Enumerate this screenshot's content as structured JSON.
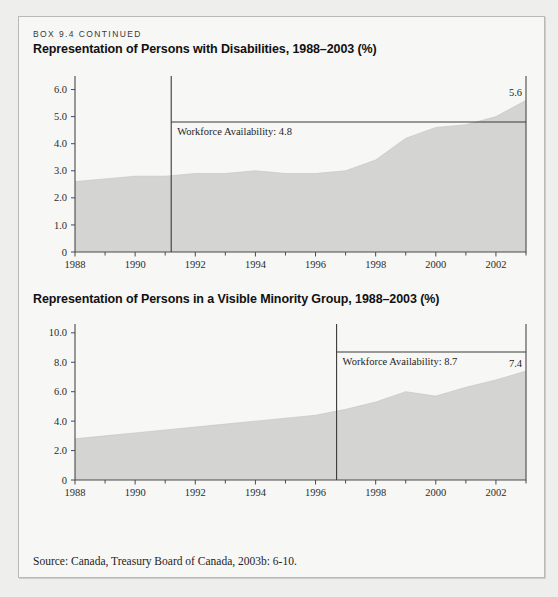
{
  "box": {
    "kicker": "BOX 9.4 CONTINUED",
    "source": "Source: Canada, Treasury Board of Canada, 2003b: 6-10."
  },
  "colors": {
    "area_fill": "#d4d4d2",
    "axis": "#4a4a4a",
    "reference_line": "#3b3b3b",
    "box_background": "#f7f7f5",
    "page_background": "#eeeeec"
  },
  "chart_data": [
    {
      "type": "area",
      "title": "Representation of Persons with Disabilities, 1988–2003 (%)",
      "xlabel": "",
      "ylabel": "",
      "xlim": [
        1988,
        2003
      ],
      "ylim": [
        0,
        6.5
      ],
      "grid": false,
      "legend": "none",
      "ytick_labels": [
        "0",
        "1.0",
        "2.0",
        "3.0",
        "4.0",
        "5.0",
        "6.0"
      ],
      "ytick_values": [
        0,
        1.0,
        2.0,
        3.0,
        4.0,
        5.0,
        6.0
      ],
      "xtick_labels": [
        "1988",
        "1990",
        "1992",
        "1994",
        "1996",
        "1998",
        "2000",
        "2002"
      ],
      "xtick_values": [
        1988,
        1990,
        1992,
        1994,
        1996,
        1998,
        2000,
        2002
      ],
      "xminor_values": [
        1989,
        1991,
        1993,
        1995,
        1997,
        1999,
        2001,
        2003
      ],
      "x": [
        1988,
        1989,
        1990,
        1991,
        1992,
        1993,
        1994,
        1995,
        1996,
        1997,
        1998,
        1999,
        2000,
        2001,
        2002,
        2003
      ],
      "values": [
        2.6,
        2.7,
        2.8,
        2.8,
        2.9,
        2.9,
        3.0,
        2.9,
        2.9,
        3.0,
        3.4,
        4.2,
        4.6,
        4.7,
        5.0,
        5.6
      ],
      "annotations": [
        {
          "type": "horizontal-line",
          "label": "Workforce Availability: 4.8",
          "value": 4.8,
          "x_start": 1991.2,
          "x_end": 2003
        },
        {
          "type": "vertical-line",
          "x": 1991.2
        },
        {
          "type": "end-value-label",
          "label": "5.6",
          "x": 2003,
          "value": 5.6
        }
      ]
    },
    {
      "type": "area",
      "title": "Representation of Persons in a Visible Minority Group, 1988–2003 (%)",
      "xlabel": "",
      "ylabel": "",
      "xlim": [
        1988,
        2003
      ],
      "ylim": [
        0,
        10.6
      ],
      "grid": false,
      "legend": "none",
      "ytick_labels": [
        "0",
        "2.0",
        "4.0",
        "6.0",
        "8.0",
        "10.0"
      ],
      "ytick_values": [
        0,
        2.0,
        4.0,
        6.0,
        8.0,
        10.0
      ],
      "xtick_labels": [
        "1988",
        "1990",
        "1992",
        "1994",
        "1996",
        "1998",
        "2000",
        "2002"
      ],
      "xtick_values": [
        1988,
        1990,
        1992,
        1994,
        1996,
        1998,
        2000,
        2002
      ],
      "xminor_values": [
        1989,
        1991,
        1993,
        1995,
        1997,
        1999,
        2001,
        2003
      ],
      "x": [
        1988,
        1989,
        1990,
        1991,
        1992,
        1993,
        1994,
        1995,
        1996,
        1997,
        1998,
        1999,
        2000,
        2001,
        2002,
        2003
      ],
      "values": [
        2.8,
        3.0,
        3.2,
        3.4,
        3.6,
        3.8,
        4.0,
        4.2,
        4.4,
        4.8,
        5.3,
        6.0,
        5.7,
        6.3,
        6.8,
        7.4
      ],
      "annotations": [
        {
          "type": "horizontal-line",
          "label": "Workforce Availability: 8.7",
          "value": 8.7,
          "x_start": 1996.7,
          "x_end": 2003
        },
        {
          "type": "vertical-line",
          "x": 1996.7
        },
        {
          "type": "end-value-label",
          "label": "7.4",
          "x": 2003,
          "value": 7.4
        }
      ]
    }
  ]
}
